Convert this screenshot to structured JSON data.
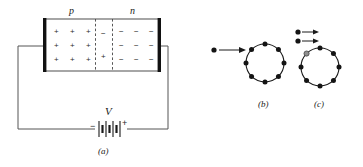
{
  "figure": {
    "title_caption_a": "(a)",
    "title_caption_b": "(b)",
    "title_caption_c": "(c)",
    "colors": {
      "ink": "#1a1a1a",
      "wire": "#555555",
      "electrode": "#111111",
      "background": "#ffffff",
      "dot": "#141414"
    }
  },
  "panel_a": {
    "caption": "(a)",
    "p_region": {
      "label": "p",
      "charge_symbol": "+",
      "rows": 3,
      "cols": 3,
      "count": 9
    },
    "n_region": {
      "label": "n",
      "charge_symbol": "−",
      "rows": 3,
      "cols": 3,
      "count": 9
    },
    "depletion_region": {
      "top_symbol": "−",
      "bottom_symbol": "+",
      "boundary_style": "dashed"
    },
    "battery": {
      "label": "V",
      "negative_terminal": "−",
      "positive_terminal": "+"
    },
    "electrodes": {
      "left": "left-electrode",
      "right": "right-electrode"
    }
  },
  "panel_b": {
    "caption": "(b)",
    "incoming_electrons": 1,
    "ring_dots": 8,
    "arrows": 1
  },
  "panel_c": {
    "caption": "(c)",
    "incoming_electrons": 2,
    "ring_dots": 8,
    "arrows": 2,
    "absorbed_dot": 1
  }
}
